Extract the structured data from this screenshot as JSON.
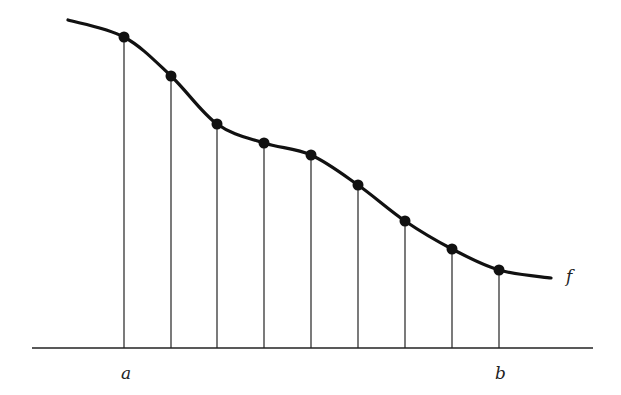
{
  "diagram": {
    "type": "riemann-sample-points",
    "function_label": "f",
    "interval_start_label": "a",
    "interval_end_label": "b",
    "stroke_color": "#111111",
    "curve": {
      "start": [
        68,
        20
      ],
      "end": [
        551,
        278
      ]
    },
    "axis": {
      "x1": 32,
      "x2": 593,
      "y": 348
    },
    "sample_points": [
      {
        "x": 124,
        "y": 37
      },
      {
        "x": 171,
        "y": 76
      },
      {
        "x": 217,
        "y": 124
      },
      {
        "x": 264,
        "y": 143
      },
      {
        "x": 311,
        "y": 155
      },
      {
        "x": 358,
        "y": 185
      },
      {
        "x": 405,
        "y": 221
      },
      {
        "x": 452,
        "y": 249
      },
      {
        "x": 499,
        "y": 270
      }
    ]
  }
}
